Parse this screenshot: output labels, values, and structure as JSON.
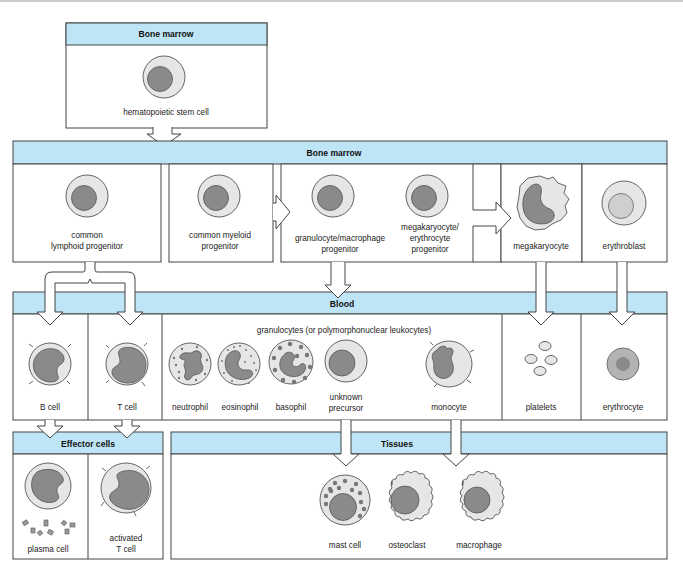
{
  "colors": {
    "header_band": "#bde5f5",
    "border": "#444444",
    "cytoplasm": "#e6e6e6",
    "nucleus": "#8a8a8a"
  },
  "sections": {
    "bone_marrow_top": {
      "title": "Bone marrow",
      "cells": [
        {
          "name": "hematopoietic stem cell",
          "label_lines": [
            "hematopoietic stem cell"
          ]
        }
      ]
    },
    "bone_marrow": {
      "title": "Bone marrow",
      "cells": [
        {
          "name": "common lymphoid progenitor",
          "label_lines": [
            "common",
            "lymphoid progenitor"
          ]
        },
        {
          "name": "common myeloid progenitor",
          "label_lines": [
            "common myeloid",
            "progenitor"
          ]
        },
        {
          "name": "granulocyte/macrophage progenitor",
          "label_lines": [
            "granulocyte/macrophage",
            "progenitor"
          ]
        },
        {
          "name": "megakaryocyte/erythrocyte progenitor",
          "label_lines": [
            "megakaryocyte/",
            "erythrocyte",
            "progenitor"
          ]
        },
        {
          "name": "megakaryocyte",
          "label_lines": [
            "megakaryocyte"
          ]
        },
        {
          "name": "erythroblast",
          "label_lines": [
            "erythroblast"
          ]
        }
      ]
    },
    "blood": {
      "title": "Blood",
      "group_label": "granulocytes (or polymorphonuclear leukocytes)",
      "cells": [
        {
          "name": "B cell",
          "label_lines": [
            "B cell"
          ]
        },
        {
          "name": "T cell",
          "label_lines": [
            "T cell"
          ]
        },
        {
          "name": "neutrophil",
          "label_lines": [
            "neutrophil"
          ]
        },
        {
          "name": "eosinophil",
          "label_lines": [
            "eosinophil"
          ]
        },
        {
          "name": "basophil",
          "label_lines": [
            "basophil"
          ]
        },
        {
          "name": "unknown precursor",
          "label_lines": [
            "unknown",
            "precursor"
          ]
        },
        {
          "name": "monocyte",
          "label_lines": [
            "monocyte"
          ]
        },
        {
          "name": "platelets",
          "label_lines": [
            "platelets"
          ]
        },
        {
          "name": "erythrocyte",
          "label_lines": [
            "erythrocyte"
          ]
        }
      ]
    },
    "effector_cells": {
      "title": "Effector cells",
      "cells": [
        {
          "name": "plasma cell",
          "label_lines": [
            "plasma cell"
          ]
        },
        {
          "name": "activated T cell",
          "label_lines": [
            "activated",
            "T cell"
          ]
        }
      ]
    },
    "tissues": {
      "title": "Tissues",
      "cells": [
        {
          "name": "mast cell",
          "label_lines": [
            "mast cell"
          ]
        },
        {
          "name": "osteoclast",
          "label_lines": [
            "osteoclast"
          ]
        },
        {
          "name": "macrophage",
          "label_lines": [
            "macrophage"
          ]
        }
      ]
    }
  },
  "edges": [
    {
      "from": "hematopoietic stem cell",
      "to": "Bone marrow progenitors"
    },
    {
      "from": "common myeloid progenitor",
      "to": "granulocyte/macrophage progenitor"
    },
    {
      "from": "megakaryocyte/erythrocyte progenitor",
      "to": "megakaryocyte"
    },
    {
      "from": "common lymphoid progenitor",
      "to": "B cell"
    },
    {
      "from": "common lymphoid progenitor",
      "to": "T cell"
    },
    {
      "from": "granulocyte/macrophage progenitor",
      "to": "Blood granulocytes/monocyte"
    },
    {
      "from": "megakaryocyte",
      "to": "platelets"
    },
    {
      "from": "erythroblast",
      "to": "erythrocyte"
    },
    {
      "from": "B cell",
      "to": "plasma cell"
    },
    {
      "from": "T cell",
      "to": "activated T cell"
    },
    {
      "from": "unknown precursor",
      "to": "mast cell"
    },
    {
      "from": "monocyte",
      "to": "macrophage"
    }
  ]
}
